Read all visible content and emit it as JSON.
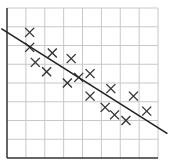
{
  "chart_data": {
    "type": "scatter",
    "title": "",
    "xlabel": "",
    "ylabel": "",
    "grid": true,
    "grid_cells": {
      "cols": 8,
      "rows": 8
    },
    "xlim": [
      0,
      8
    ],
    "ylim": [
      0,
      8
    ],
    "points": [
      {
        "x": 1.2,
        "y": 6.7
      },
      {
        "x": 1.2,
        "y": 5.9
      },
      {
        "x": 1.5,
        "y": 5.1
      },
      {
        "x": 2.4,
        "y": 5.6
      },
      {
        "x": 2.1,
        "y": 4.6
      },
      {
        "x": 3.4,
        "y": 5.3
      },
      {
        "x": 3.2,
        "y": 4.0
      },
      {
        "x": 3.8,
        "y": 4.3
      },
      {
        "x": 4.4,
        "y": 4.5
      },
      {
        "x": 4.4,
        "y": 3.3
      },
      {
        "x": 5.5,
        "y": 3.7
      },
      {
        "x": 5.2,
        "y": 2.7
      },
      {
        "x": 5.7,
        "y": 2.3
      },
      {
        "x": 6.3,
        "y": 2.0
      },
      {
        "x": 6.7,
        "y": 3.3
      },
      {
        "x": 7.4,
        "y": 2.5
      }
    ],
    "trend_line": {
      "x1": -0.3,
      "y1": 6.9,
      "x2": 8.5,
      "y2": 1.3
    },
    "colors": {
      "grid": "#c8c8c8",
      "axis": "#333333",
      "marker": "#333333",
      "line": "#222222"
    }
  }
}
